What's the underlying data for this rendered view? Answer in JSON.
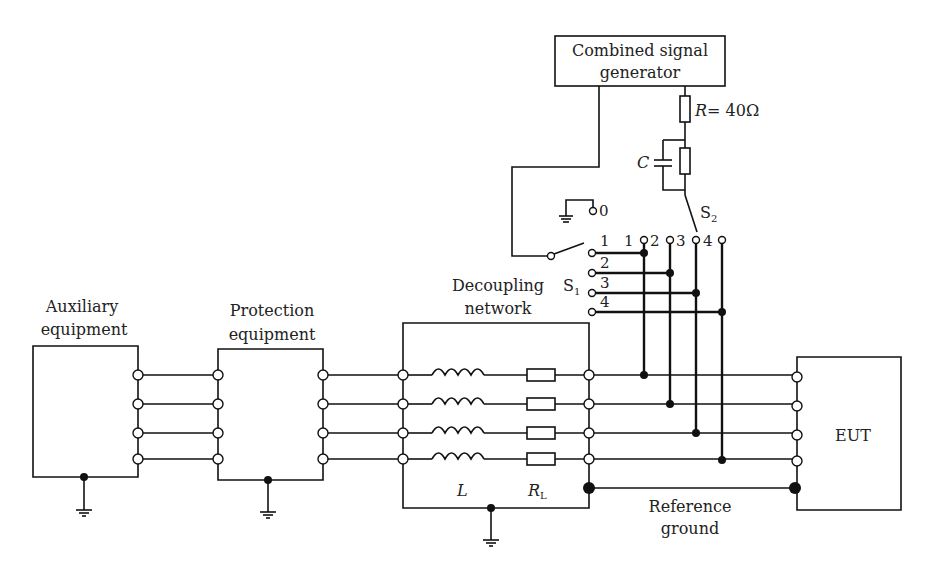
{
  "diagram": {
    "generator": {
      "line1": "Combined signal",
      "line2": "generator"
    },
    "resistor_r": {
      "label": "R",
      "value": "= 40Ω"
    },
    "capacitor": {
      "label": "C"
    },
    "switch_s1": {
      "label": "S",
      "sub": "1",
      "positions": [
        "0",
        "1",
        "2",
        "3",
        "4"
      ]
    },
    "switch_s2": {
      "label": "S",
      "sub": "2",
      "positions": [
        "1",
        "2",
        "3",
        "4"
      ]
    },
    "auxiliary": {
      "line1": "Auxiliary",
      "line2": "equipment"
    },
    "protection": {
      "line1": "Protection",
      "line2": "equipment"
    },
    "decoupling": {
      "line1": "Decoupling",
      "line2": "network",
      "inductor_label": "L",
      "resistor_label": "R",
      "resistor_sub": "L"
    },
    "eut": {
      "label": "EUT"
    },
    "reference_ground": {
      "line1": "Reference",
      "line2": "ground"
    }
  }
}
